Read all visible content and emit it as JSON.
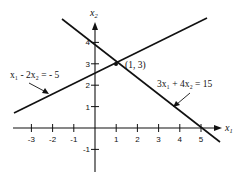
{
  "diagram": {
    "type": "linear-equations-graph",
    "colors": {
      "ink": "#111111",
      "background": "#ffffff"
    },
    "axes": {
      "x_label": "x",
      "x_label_sub": "1",
      "y_label": "x",
      "y_label_sub": "2",
      "x_ticks": [
        "-3",
        "-2",
        "-1",
        "1",
        "2",
        "3",
        "4",
        "5"
      ],
      "y_ticks": [
        "4",
        "3",
        "2",
        "1",
        "-1"
      ]
    },
    "lines": [
      {
        "id": "line-a",
        "equation": "3x₁ + 4x₂ = 15"
      },
      {
        "id": "line-b",
        "equation": "x₁ - 2x₂ = - 5"
      }
    ],
    "intersection": {
      "label": "(1, 3)",
      "x": 1,
      "y": 3
    }
  }
}
